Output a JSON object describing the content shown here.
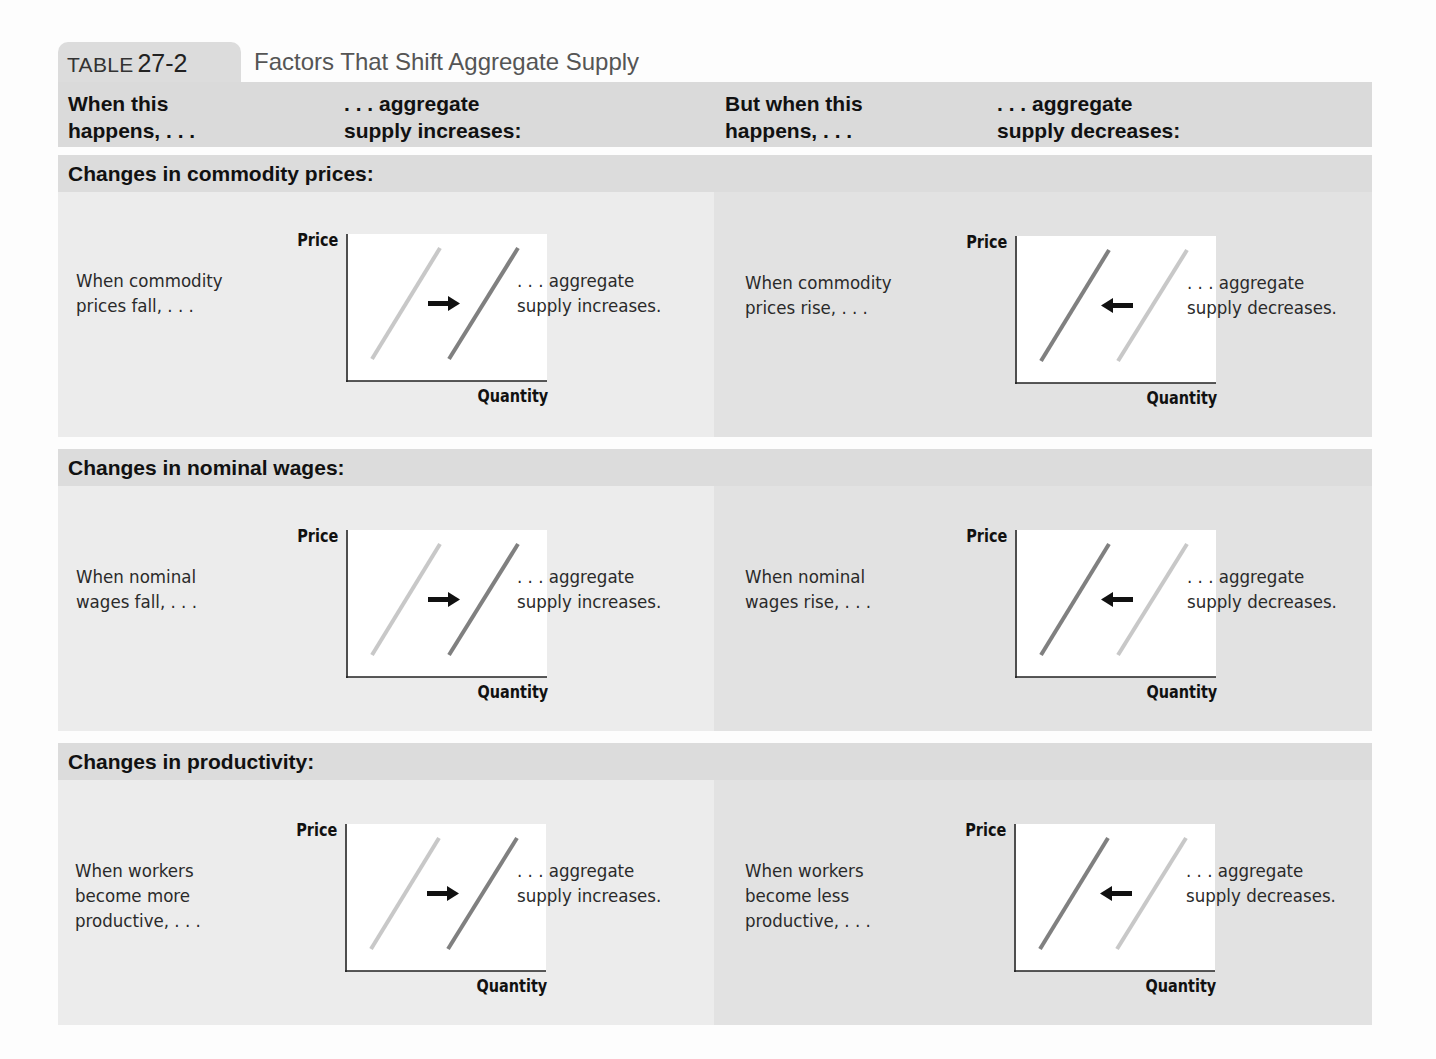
{
  "table": {
    "label": "TABLE",
    "number": "27-2",
    "title": "Factors That Shift Aggregate Supply"
  },
  "columns": [
    "When this\nhappens, . . .",
    ". . . aggregate\nsupply increases:",
    "But when this\nhappens, . . .",
    ". . . aggregate\nsupply decreases:"
  ],
  "axes": {
    "y": "Price",
    "x": "Quantity"
  },
  "colors": {
    "original_curve": "#c8c8c8",
    "shifted_curve": "#808080",
    "arrow": "#111111",
    "header_band": "#dadada",
    "panel_left": "#ececec",
    "panel_right": "#e2e2e2"
  },
  "sections": [
    {
      "title": "Changes in commodity prices:",
      "increase": {
        "cause": "When commodity\nprices fall, . . .",
        "effect": ". . . aggregate\nsupply increases.",
        "shift": "right"
      },
      "decrease": {
        "cause": "When commodity\nprices rise, . . .",
        "effect": ". . . aggregate\nsupply decreases.",
        "shift": "left"
      }
    },
    {
      "title": "Changes in nominal wages:",
      "increase": {
        "cause": "When nominal\nwages fall, . . .",
        "effect": ". . . aggregate\nsupply increases.",
        "shift": "right"
      },
      "decrease": {
        "cause": "When nominal\nwages rise, . . .",
        "effect": ". . . aggregate\nsupply decreases.",
        "shift": "left"
      }
    },
    {
      "title": "Changes in productivity:",
      "increase": {
        "cause": "When workers\nbecome more\nproductive, . . .",
        "effect": ". . . aggregate\nsupply increases.",
        "shift": "right"
      },
      "decrease": {
        "cause": "When workers\nbecome less\nproductive, . . .",
        "effect": ". . . aggregate\nsupply decreases.",
        "shift": "left"
      }
    }
  ]
}
